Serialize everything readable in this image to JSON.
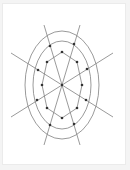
{
  "diagram": {
    "colors": {
      "line": "#808080",
      "dot": "#333333",
      "background": "#ffffff"
    },
    "center": {
      "x": 62,
      "y": 85
    },
    "ellipses": [
      {
        "rx": 37,
        "ry": 54
      },
      {
        "rx": 29,
        "ry": 44
      }
    ],
    "rays": [
      {
        "x1": 44,
        "y1": 25,
        "x2": 80,
        "y2": 145
      },
      {
        "x1": 80,
        "y1": 25,
        "x2": 44,
        "y2": 145
      },
      {
        "x1": 11,
        "y1": 53,
        "x2": 113,
        "y2": 117
      },
      {
        "x1": 11,
        "y1": 117,
        "x2": 113,
        "y2": 53
      }
    ],
    "inner_polygon": [
      [
        62,
        52
      ],
      [
        77,
        62
      ],
      [
        82,
        85
      ],
      [
        77,
        108
      ],
      [
        62,
        118
      ],
      [
        47,
        108
      ],
      [
        42,
        85
      ],
      [
        47,
        62
      ]
    ],
    "outer_dots": [
      [
        50,
        46
      ],
      [
        74,
        44
      ],
      [
        38,
        70
      ],
      [
        87,
        69
      ],
      [
        37,
        100
      ],
      [
        86,
        100
      ],
      [
        50,
        125
      ],
      [
        74,
        124
      ]
    ]
  }
}
